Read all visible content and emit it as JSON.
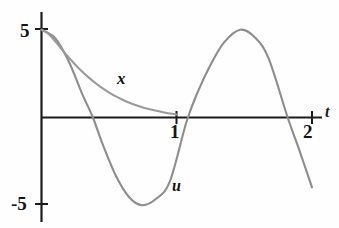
{
  "figure": {
    "background_color": "#fefefe",
    "axis_color": "#1b1b1b",
    "curve_color": "#8f8f8f"
  },
  "axes": {
    "t_axis_name": "t",
    "tick_1_label": "1",
    "tick_2_label": "2",
    "y_tick_pos_label": "5",
    "y_tick_neg_label": "-5"
  },
  "curves": {
    "x_label": "x",
    "u_label": "u"
  },
  "chart_data": {
    "type": "line",
    "title": "",
    "xlabel": "t",
    "ylabel": "",
    "xlim": [
      0,
      2.02
    ],
    "ylim": [
      -6.2,
      6.3
    ],
    "xticks": [
      1,
      2
    ],
    "xticklabels": [
      "1",
      "2"
    ],
    "yticks": [
      5,
      -5
    ],
    "yticklabels": [
      "5",
      "-5"
    ],
    "grid": false,
    "legend": "inline-curve-labels",
    "annotations": [
      {
        "text": "x",
        "t": 0.56,
        "value": 2.6
      },
      {
        "text": "u",
        "t": 0.97,
        "value": -3.5
      }
    ],
    "series": [
      {
        "name": "x",
        "label": "x",
        "description": "decaying exponential from 5 toward 0",
        "x": [
          0.0,
          0.05,
          0.1,
          0.15,
          0.2,
          0.25,
          0.3,
          0.35,
          0.4,
          0.45,
          0.5,
          0.55,
          0.6,
          0.65,
          0.7,
          0.75,
          0.8,
          0.85,
          0.9,
          0.95,
          1.0
        ],
        "values": [
          5.0,
          4.78,
          4.35,
          3.88,
          3.43,
          3.01,
          2.62,
          2.27,
          1.95,
          1.67,
          1.42,
          1.2,
          1.01,
          0.84,
          0.7,
          0.57,
          0.47,
          0.38,
          0.3,
          0.23,
          0.17
        ]
      },
      {
        "name": "u",
        "label": "u",
        "description": "sinusoid, amplitude 5, period about 1.44",
        "x": [
          0.0,
          0.1,
          0.2,
          0.3,
          0.38,
          0.45,
          0.55,
          0.65,
          0.745,
          0.85,
          0.95,
          1.07,
          1.15,
          1.25,
          1.35,
          1.47,
          1.58,
          1.68,
          1.82,
          1.9,
          2.0
        ],
        "values": [
          5.0,
          4.53,
          3.22,
          1.36,
          0.0,
          -1.48,
          -3.32,
          -4.56,
          -5.0,
          -4.62,
          -3.62,
          -0.3,
          1.36,
          3.0,
          4.28,
          5.0,
          4.55,
          3.35,
          0.0,
          -1.72,
          -3.98
        ]
      }
    ]
  }
}
